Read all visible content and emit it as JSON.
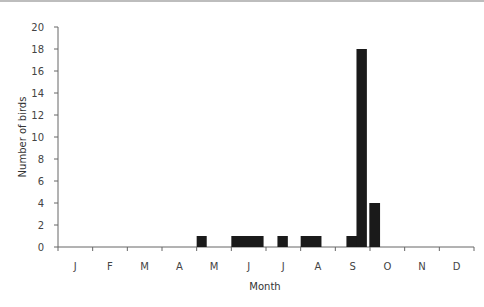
{
  "chart_data": {
    "type": "bar",
    "title": "",
    "xlabel": "Month",
    "ylabel": "Number of birds",
    "ylim": [
      0,
      20
    ],
    "yticks": [
      0,
      2,
      4,
      6,
      8,
      10,
      12,
      14,
      16,
      18,
      20
    ],
    "categories": [
      "J",
      "F",
      "M",
      "A",
      "M",
      "J",
      "J",
      "A",
      "S",
      "O",
      "N",
      "D"
    ],
    "grid": false,
    "legend": null,
    "bars": [
      {
        "month": "May",
        "start": 4.0,
        "end": 0.29,
        "value": 1
      },
      {
        "month": "June",
        "start": 5.0,
        "end": 0.93,
        "value": 1
      },
      {
        "month": "July",
        "start": 6.33,
        "end": 0.3,
        "value": 1
      },
      {
        "month": "August",
        "start": 7.0,
        "end": 0.6,
        "value": 1
      },
      {
        "month": "September",
        "start": 8.32,
        "end": 0.31,
        "value": 1
      },
      {
        "month": "September",
        "start": 8.61,
        "end": 0.3,
        "value": 18
      },
      {
        "month": "October",
        "start": 8.98,
        "end": 0.31,
        "value": 4
      }
    ],
    "values_by_month": [
      0,
      0,
      0,
      0,
      1,
      1,
      1,
      1,
      19,
      4,
      0,
      0
    ],
    "bar_color": "#1a1a1a"
  }
}
